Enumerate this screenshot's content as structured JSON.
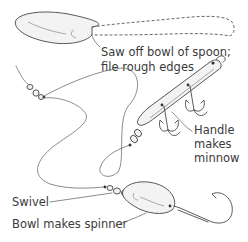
{
  "diagram": {
    "labels": {
      "saw_off_line1": "Saw off bowl of spoon;",
      "saw_off_line2": "file rough edges",
      "handle_line1": "Handle",
      "handle_line2": "makes",
      "handle_line3": "minnow",
      "swivel": "Swivel",
      "bowl_spinner": "Bowl makes spinner"
    },
    "parts": [
      "spoon-bowl",
      "spoon-handle-dashed",
      "minnow-lure",
      "treble-hooks",
      "swivels",
      "fishing-line",
      "spinner-bowl",
      "single-hook"
    ]
  }
}
